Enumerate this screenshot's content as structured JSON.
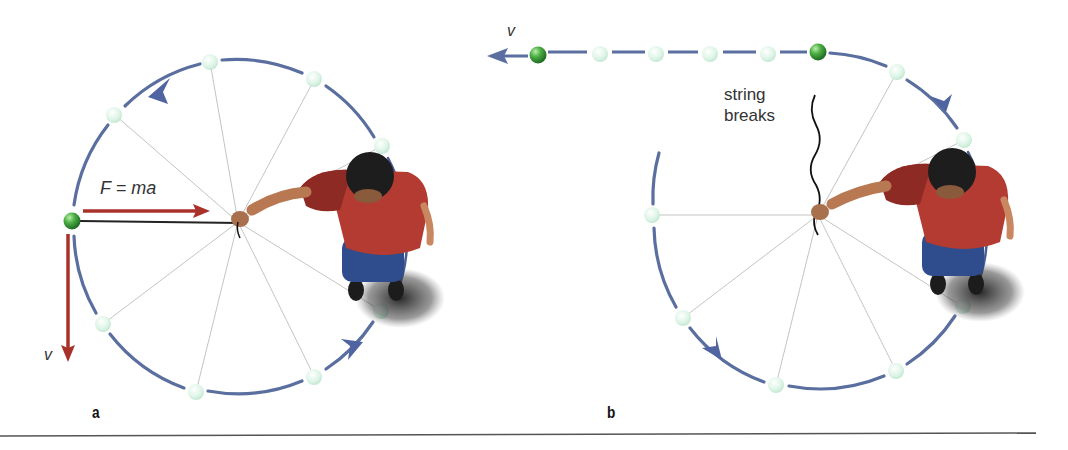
{
  "figure": {
    "panels": [
      {
        "id": "a",
        "label": "a",
        "force_label": "F = ma",
        "velocity_label": "v",
        "description": "Ball on a string whirled in a circle; centripetal force points toward the center, velocity is tangent."
      },
      {
        "id": "b",
        "label": "b",
        "velocity_label": "v",
        "annotation": "string breaks",
        "annotation_lines": [
          "string",
          "breaks"
        ],
        "description": "When the string breaks, the ball travels in a straight line tangent to the circle."
      }
    ],
    "colors": {
      "path": "#5a6fa0",
      "force_arrow": "#a8322a",
      "ball_active": "#3e9a3a",
      "ball_ghost": "#d8f2e4",
      "spoke": "#bcbcbc",
      "string": "#1a1a1a",
      "divider": "#555555"
    }
  }
}
